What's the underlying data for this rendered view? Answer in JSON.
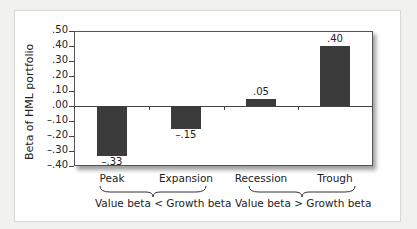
{
  "chart_data": {
    "type": "bar",
    "title": "",
    "xlabel": "",
    "ylabel": "Beta of HML portfolio",
    "categories": [
      "Peak",
      "Expansion",
      "Recession",
      "Trough"
    ],
    "values": [
      -0.33,
      -0.15,
      0.05,
      0.4
    ],
    "value_labels": [
      "–.33",
      "–.15",
      ".05",
      ".40"
    ],
    "ylim": [
      -0.4,
      0.5
    ],
    "yticks": [
      ".50",
      ".40",
      ".30",
      ".20",
      ".10",
      ".00",
      "–.10",
      "–.20",
      "–.30",
      "–.40"
    ],
    "grid": false,
    "bar_color": "#3b3b3b",
    "groups": [
      {
        "label": "Value beta < Growth beta",
        "categories": [
          "Peak",
          "Expansion"
        ]
      },
      {
        "label": "Value beta > Growth beta",
        "categories": [
          "Recession",
          "Trough"
        ]
      }
    ]
  }
}
